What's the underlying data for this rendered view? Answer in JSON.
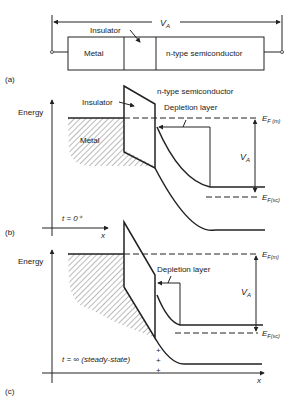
{
  "panel_a": {
    "label": "(a)",
    "voltage_label": "V",
    "voltage_sub": "A",
    "insulator_label": "Insulator",
    "metal_label": "Metal",
    "semiconductor_label": "n-type semiconductor"
  },
  "panel_b": {
    "label": "(b)",
    "energy_label": "Energy",
    "insulator_label": "Insulator",
    "semiconductor_label": "n-type semiconductor",
    "depletion_label": "Depletion layer",
    "metal_label": "Metal",
    "ef_m_label": "E",
    "ef_m_sub": "F (m)",
    "ef_sc_label": "E",
    "ef_sc_sub": "F(sc)",
    "va_label": "V",
    "va_sub": "A",
    "time_label": "t = 0⁺",
    "x_label": "x"
  },
  "panel_c": {
    "label": "(c)",
    "energy_label": "Energy",
    "depletion_label": "Depletion layer",
    "ef_m_label": "E",
    "ef_m_sub": "F(m)",
    "ef_sc_label": "E",
    "ef_sc_sub": "F(sc)",
    "va_label": "V",
    "va_sub": "A",
    "time_label": "t = ∞ (steady-state)",
    "x_label": "x",
    "charge_marks": [
      "+",
      "+",
      "+"
    ]
  },
  "colors": {
    "line": "#222222",
    "background": "#ffffff"
  }
}
